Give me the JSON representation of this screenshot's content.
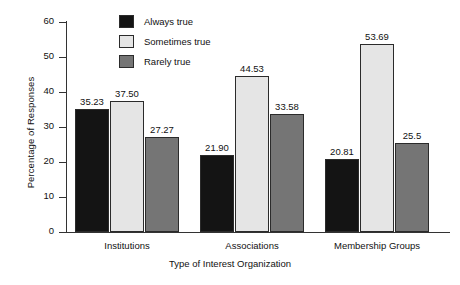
{
  "chart_data": {
    "type": "bar",
    "title": "",
    "xlabel": "Type of Interest Organization",
    "ylabel": "Percentage of Responses",
    "categories": [
      "Institutions",
      "Associations",
      "Membership Groups"
    ],
    "series": [
      {
        "name": "Always true",
        "color": "#141414",
        "values": [
          35.23,
          21.9,
          20.81
        ],
        "labels": [
          "35.23",
          "21.90",
          "20.81"
        ]
      },
      {
        "name": "Sometimes true",
        "color": "#e5e5e5",
        "values": [
          37.5,
          44.53,
          53.69
        ],
        "labels": [
          "37.50",
          "44.53",
          "53.69"
        ]
      },
      {
        "name": "Rarely true",
        "color": "#757575",
        "values": [
          27.27,
          33.58,
          25.5
        ],
        "labels": [
          "27.27",
          "33.58",
          "25.5"
        ]
      }
    ],
    "ylim": [
      0,
      60
    ],
    "yticks": [
      0,
      10,
      20,
      30,
      40,
      50,
      60
    ],
    "ytick_labels": [
      "0",
      "10",
      "20",
      "30",
      "40",
      "50",
      "60"
    ],
    "grid": false,
    "legend_position": "top-center",
    "bar_edge_color": "#2b2b2b",
    "axis_color": "#333333"
  }
}
